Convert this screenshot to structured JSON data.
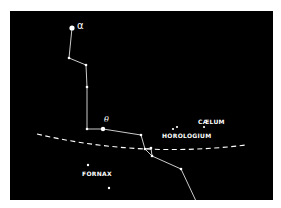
{
  "colors": {
    "background": "#000000",
    "foreground": "#ffffff",
    "page": "#ffffff"
  },
  "labels": {
    "alpha": "α",
    "theta": "θ",
    "fornax": "FORNAX",
    "horologium": "HOROLOGIUM",
    "caelum": "CÆLUM"
  },
  "stars": [
    {
      "id": "alpha",
      "x": 72,
      "y": 28,
      "r": 2.6
    },
    {
      "id": "s1",
      "x": 69,
      "y": 58,
      "r": 1.3
    },
    {
      "id": "s2",
      "x": 86,
      "y": 65,
      "r": 1.3
    },
    {
      "id": "s3",
      "x": 87,
      "y": 87,
      "r": 1.3
    },
    {
      "id": "s4",
      "x": 87,
      "y": 129,
      "r": 1.3
    },
    {
      "id": "theta",
      "x": 103,
      "y": 129,
      "r": 2.2
    },
    {
      "id": "s5",
      "x": 141,
      "y": 135,
      "r": 1.3
    },
    {
      "id": "s6",
      "x": 145,
      "y": 149,
      "r": 1.3
    },
    {
      "id": "s7",
      "x": 151,
      "y": 148,
      "r": 1.3
    },
    {
      "id": "s8",
      "x": 152,
      "y": 156,
      "r": 1.3
    },
    {
      "id": "s9",
      "x": 181,
      "y": 169,
      "r": 1.3
    },
    {
      "id": "horologium-1",
      "x": 173,
      "y": 129,
      "r": 1.1
    },
    {
      "id": "horologium-2",
      "x": 177,
      "y": 127,
      "r": 1.1
    },
    {
      "id": "caelum-1",
      "x": 204,
      "y": 127,
      "r": 1.1
    },
    {
      "id": "fornax-1",
      "x": 88,
      "y": 165,
      "r": 1.2
    },
    {
      "id": "fornax-2",
      "x": 109,
      "y": 188,
      "r": 1.2
    }
  ],
  "constellation_line": [
    [
      72,
      28
    ],
    [
      69,
      58
    ],
    [
      86,
      65
    ],
    [
      87,
      87
    ],
    [
      87,
      129
    ],
    [
      103,
      129
    ],
    [
      141,
      135
    ],
    [
      145,
      149
    ],
    [
      152,
      156
    ],
    [
      181,
      169
    ],
    [
      196,
      201
    ]
  ],
  "spur_line": [
    [
      145,
      149
    ],
    [
      151,
      148
    ],
    [
      152,
      156
    ]
  ],
  "dashed_curve": "M 37 134 Q 140 158 246 145"
}
